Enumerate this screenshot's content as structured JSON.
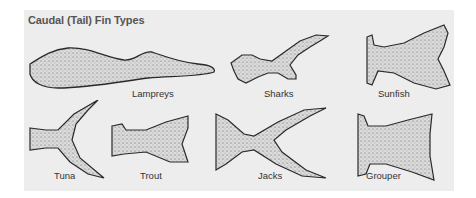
{
  "title": "Caudal (Tail) Fin Types",
  "fins": [
    {
      "name": "Lampreys"
    },
    {
      "name": "Sharks"
    },
    {
      "name": "Sunfish"
    },
    {
      "name": "Tuna"
    },
    {
      "name": "Trout"
    },
    {
      "name": "Jacks"
    },
    {
      "name": "Grouper"
    }
  ],
  "colors": {
    "background": "#ffffff",
    "panel": "#ededed",
    "ink": "#2a2a2a"
  }
}
